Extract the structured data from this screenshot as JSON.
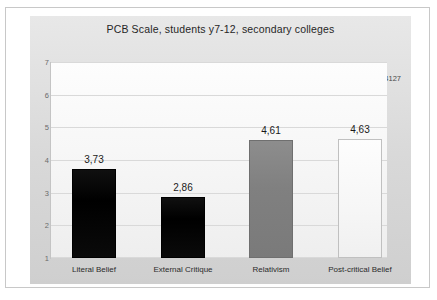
{
  "chart_data": {
    "type": "bar",
    "title": "PCB Scale, students y7-12, secondary colleges",
    "categories": [
      "Literal Belief",
      "External Critique",
      "Relativism",
      "Post-critical Belief"
    ],
    "values": [
      3.73,
      2.86,
      4.61,
      4.63
    ],
    "value_labels": [
      "3,73",
      "2,86",
      "4,61",
      "4,63"
    ],
    "bar_colors": [
      "#000000",
      "#000000",
      "#808080",
      "#f7f7f7"
    ],
    "xlabel": "",
    "ylabel": "",
    "ylim": [
      1,
      7
    ],
    "yticks": [
      "7",
      "6",
      "5",
      "4",
      "3",
      "2",
      "1"
    ],
    "ytick_values": [
      7,
      6,
      5,
      4,
      3,
      2,
      1
    ],
    "grid": true,
    "legend": "none",
    "annotations": [
      {
        "text": "n=4127",
        "position": "top-right"
      }
    ]
  },
  "annotation": {
    "sample_size": "n=4127"
  }
}
